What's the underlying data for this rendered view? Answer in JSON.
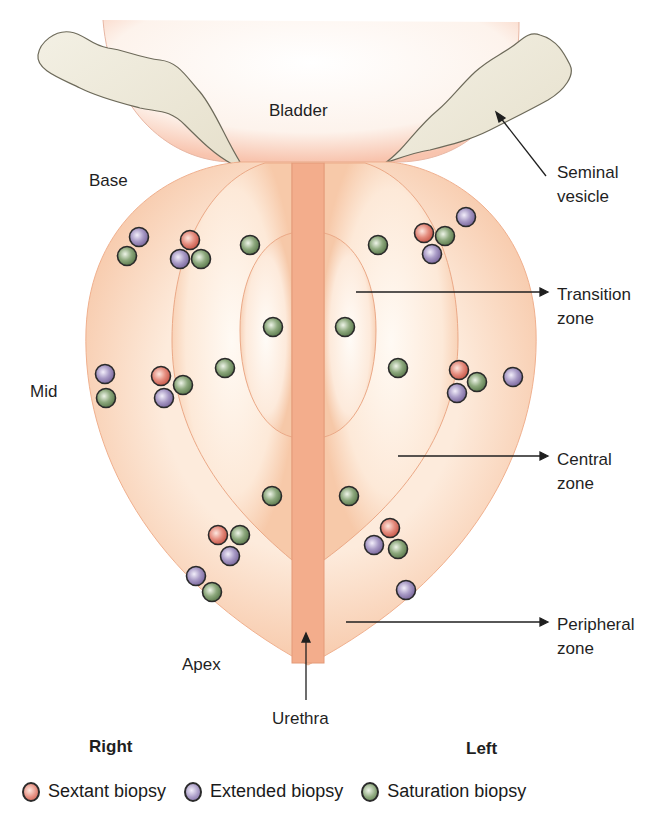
{
  "labels": {
    "bladder": "Bladder",
    "seminal_vesicle_line1": "Seminal",
    "seminal_vesicle_line2": "vesicle",
    "base": "Base",
    "mid": "Mid",
    "apex": "Apex",
    "urethra": "Urethra",
    "transition_line1": "Transition",
    "transition_line2": "zone",
    "central_line1": "Central",
    "central_line2": "zone",
    "peripheral_line1": "Peripheral",
    "peripheral_line2": "zone",
    "right": "Right",
    "left": "Left"
  },
  "legend": [
    {
      "label": "Sextant biopsy",
      "color": "#e0786c"
    },
    {
      "label": "Extended biopsy",
      "color": "#9c8cb8"
    },
    {
      "label": "Saturation biopsy",
      "color": "#7c9a6c"
    }
  ],
  "colors": {
    "sextant": "#e0786c",
    "extended": "#9c8cb8",
    "saturation": "#7c9a6c",
    "prostate": "#f7c9a8",
    "urethra": "#f2aa88",
    "seminal_vesicle": "#efebdc"
  },
  "biopsy_points": [
    {
      "type": "extended",
      "x": 139,
      "y": 237
    },
    {
      "type": "saturation",
      "x": 127,
      "y": 256
    },
    {
      "type": "sextant",
      "x": 190,
      "y": 240
    },
    {
      "type": "extended",
      "x": 180,
      "y": 259
    },
    {
      "type": "saturation",
      "x": 201,
      "y": 259
    },
    {
      "type": "saturation",
      "x": 250,
      "y": 245
    },
    {
      "type": "saturation",
      "x": 273,
      "y": 327
    },
    {
      "type": "saturation",
      "x": 225,
      "y": 368
    },
    {
      "type": "extended",
      "x": 105,
      "y": 374
    },
    {
      "type": "saturation",
      "x": 106,
      "y": 398
    },
    {
      "type": "sextant",
      "x": 161,
      "y": 376
    },
    {
      "type": "extended",
      "x": 164,
      "y": 398
    },
    {
      "type": "saturation",
      "x": 183,
      "y": 385
    },
    {
      "type": "saturation",
      "x": 272,
      "y": 496
    },
    {
      "type": "sextant",
      "x": 218,
      "y": 535
    },
    {
      "type": "saturation",
      "x": 240,
      "y": 535
    },
    {
      "type": "extended",
      "x": 230,
      "y": 556
    },
    {
      "type": "extended",
      "x": 196,
      "y": 576
    },
    {
      "type": "saturation",
      "x": 212,
      "y": 592
    },
    {
      "type": "saturation",
      "x": 378,
      "y": 245
    },
    {
      "type": "sextant",
      "x": 424,
      "y": 233
    },
    {
      "type": "saturation",
      "x": 445,
      "y": 236
    },
    {
      "type": "extended",
      "x": 432,
      "y": 254
    },
    {
      "type": "extended",
      "x": 466,
      "y": 217
    },
    {
      "type": "saturation",
      "x": 345,
      "y": 327
    },
    {
      "type": "saturation",
      "x": 398,
      "y": 368
    },
    {
      "type": "sextant",
      "x": 459,
      "y": 370
    },
    {
      "type": "saturation",
      "x": 477,
      "y": 382
    },
    {
      "type": "extended",
      "x": 457,
      "y": 393
    },
    {
      "type": "extended",
      "x": 513,
      "y": 377
    },
    {
      "type": "saturation",
      "x": 349,
      "y": 496
    },
    {
      "type": "sextant",
      "x": 390,
      "y": 528
    },
    {
      "type": "extended",
      "x": 374,
      "y": 545
    },
    {
      "type": "saturation",
      "x": 398,
      "y": 549
    },
    {
      "type": "extended",
      "x": 406,
      "y": 590
    }
  ]
}
